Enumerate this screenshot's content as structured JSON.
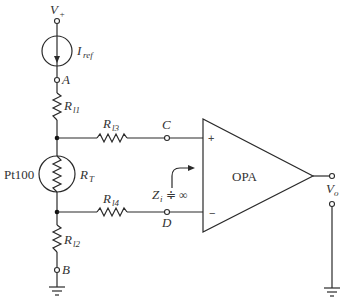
{
  "diagram": {
    "type": "circuit-schematic",
    "labels": {
      "supply": "V",
      "supply_sub": "+",
      "current_source": "I",
      "current_source_sub": "ref",
      "node_a": "A",
      "node_b": "B",
      "node_c": "C",
      "node_d": "D",
      "r_l1": "R",
      "r_l1_sub": "l1",
      "r_l2": "R",
      "r_l2_sub": "l2",
      "r_l3": "R",
      "r_l3_sub": "l3",
      "r_l4": "R",
      "r_l4_sub": "l4",
      "r_t": "R",
      "r_t_sub": "T",
      "sensor": "Pt100",
      "opamp": "OPA",
      "plus": "+",
      "minus": "−",
      "impedance": "Z",
      "impedance_sub": "i",
      "impedance_value": "≑ ∞",
      "output": "V",
      "output_sub": "o"
    },
    "colors": {
      "line": "#2a2a2a",
      "text": "#333333",
      "background": "#ffffff"
    }
  }
}
